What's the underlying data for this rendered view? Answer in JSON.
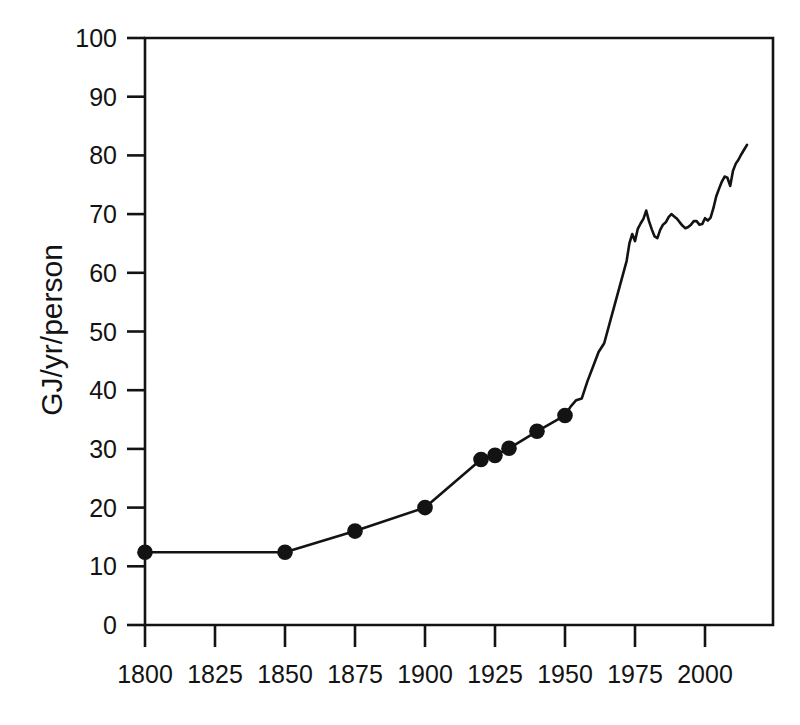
{
  "chart_data": {
    "type": "line",
    "title": "",
    "subtitle": "",
    "xlabel": "",
    "ylabel": "GJ/yr/person",
    "xlim": [
      1800,
      2015
    ],
    "ylim": [
      0,
      100
    ],
    "grid": false,
    "legend": null,
    "annotations": [],
    "xticks": [
      1800,
      1825,
      1850,
      1875,
      1900,
      1925,
      1950,
      1975,
      2000
    ],
    "xticklabels": [
      "1800",
      "1825",
      "1850",
      "1875",
      "1900",
      "1925",
      "1950",
      "1975",
      "2000"
    ],
    "yticks": [
      0,
      10,
      20,
      30,
      40,
      50,
      60,
      70,
      80,
      90,
      100
    ],
    "yticklabels": [
      "0",
      "10",
      "20",
      "30",
      "40",
      "50",
      "60",
      "70",
      "80",
      "90",
      "100"
    ],
    "series": [
      {
        "name": "Global primary energy use per person",
        "marker": "filled-circle",
        "marker_years": [
          1800,
          1850,
          1875,
          1900,
          1920,
          1925,
          1930,
          1940,
          1950
        ],
        "marker_values": [
          12.4,
          12.4,
          16.0,
          20.0,
          28.2,
          28.9,
          30.1,
          33.0,
          35.7
        ],
        "x": [
          1800,
          1850,
          1875,
          1900,
          1920,
          1925,
          1930,
          1940,
          1950,
          1952,
          1954,
          1956,
          1958,
          1960,
          1962,
          1964,
          1966,
          1968,
          1970,
          1972,
          1973,
          1974,
          1975,
          1976,
          1977,
          1978,
          1979,
          1980,
          1981,
          1982,
          1983,
          1984,
          1985,
          1986,
          1987,
          1988,
          1989,
          1990,
          1991,
          1992,
          1993,
          1994,
          1995,
          1996,
          1997,
          1998,
          1999,
          2000,
          2001,
          2002,
          2003,
          2004,
          2005,
          2006,
          2007,
          2008,
          2009,
          2010,
          2011,
          2012,
          2013,
          2014,
          2015
        ],
        "y": [
          12.4,
          12.4,
          16.0,
          20.0,
          28.2,
          28.9,
          30.1,
          33.0,
          35.7,
          37.2,
          38.3,
          38.6,
          41.5,
          44.0,
          46.5,
          48.0,
          51.5,
          55.0,
          58.5,
          62.0,
          65.0,
          66.6,
          65.4,
          67.5,
          68.4,
          69.2,
          70.6,
          68.8,
          67.4,
          66.2,
          65.9,
          67.3,
          68.2,
          68.6,
          69.5,
          70.0,
          69.6,
          69.2,
          68.6,
          68.0,
          67.6,
          67.8,
          68.2,
          68.8,
          68.8,
          68.2,
          68.3,
          69.3,
          68.9,
          69.4,
          71.0,
          73.0,
          74.3,
          75.5,
          76.4,
          76.2,
          74.8,
          77.4,
          78.6,
          79.3,
          80.2,
          81.0,
          81.8
        ]
      }
    ]
  },
  "axes": {
    "y_axis_label": "GJ/yr/person"
  }
}
